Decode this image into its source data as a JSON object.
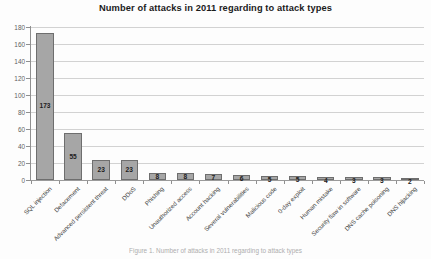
{
  "chart_data": {
    "type": "bar",
    "title": "Number of attacks in 2011 regarding to attack types",
    "xlabel": "",
    "ylabel": "",
    "ylim": [
      0,
      180
    ],
    "ytick_step": 20,
    "yticks": [
      "0",
      "20",
      "40",
      "60",
      "80",
      "100",
      "120",
      "140",
      "160",
      "180"
    ],
    "grid": true,
    "legend": false,
    "bar_color": "#a6a6a6",
    "bar_border_color": "#6e6e6e",
    "categories": [
      "SQL injection",
      "Defacement",
      "Advanced persistent threat",
      "DDoS",
      "Phishing",
      "Unauthorized access",
      "Account hacking",
      "Several vulnerabilities",
      "Malicious code",
      "0-day exploit",
      "Human mistake",
      "Security flaw in software",
      "DNS cache poisoning",
      "DNS hijacking"
    ],
    "values": [
      173,
      55,
      23,
      23,
      8,
      8,
      7,
      6,
      5,
      5,
      4,
      3,
      3,
      2
    ],
    "value_labels": [
      "173",
      "55",
      "23",
      "23",
      "8",
      "8",
      "7",
      "6",
      "5",
      "5",
      "4",
      "3",
      "3",
      "2"
    ]
  },
  "caption": {
    "text": "Figure 1. Number of attacks in 2011 regarding to attack types"
  }
}
